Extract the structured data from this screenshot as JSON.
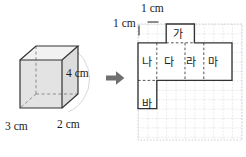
{
  "figure": {
    "solid": {
      "name": "rectangular prism",
      "dimensions": [
        {
          "label": "3 cm",
          "value": 3,
          "unit": "cm",
          "edge": "width"
        },
        {
          "label": "2 cm",
          "value": 2,
          "unit": "cm",
          "edge": "depth"
        },
        {
          "label": "4 cm",
          "value": 4,
          "unit": "cm",
          "edge": "height"
        }
      ],
      "face_fill": "#e3e3e3",
      "edge_color": "#333333",
      "hidden_edge_color": "#8a8a8a"
    },
    "arrow": {
      "icon": "right-arrow-icon",
      "color": "#707070",
      "direction": "right"
    },
    "grid": {
      "cell_label_top": "1 cm",
      "cell_label_left": "1 cm",
      "cell_size_cm": 1,
      "line_color": "#c9ccd1",
      "style": "dotted",
      "columns": 11,
      "rows": 12
    },
    "net": {
      "outline_color": "#333333",
      "fold_line_color": "#555555",
      "fold_line_style": "dashed",
      "faces": [
        {
          "id": "ga",
          "label": "가",
          "width_cm": 3,
          "height_cm": 2,
          "col": 3,
          "row": 0
        },
        {
          "id": "na",
          "label": "나",
          "width_cm": 2,
          "height_cm": 4,
          "col": 0,
          "row": 2
        },
        {
          "id": "da",
          "label": "다",
          "width_cm": 3,
          "height_cm": 4,
          "col": 2,
          "row": 2
        },
        {
          "id": "ra",
          "label": "라",
          "width_cm": 2,
          "height_cm": 4,
          "col": 5,
          "row": 2
        },
        {
          "id": "ma",
          "label": "마",
          "width_cm": 3,
          "height_cm": 4,
          "col": 7,
          "row": 2
        },
        {
          "id": "ba",
          "label": "바",
          "width_cm": 2,
          "height_cm": 3,
          "col": 0,
          "row": 6
        }
      ]
    }
  }
}
